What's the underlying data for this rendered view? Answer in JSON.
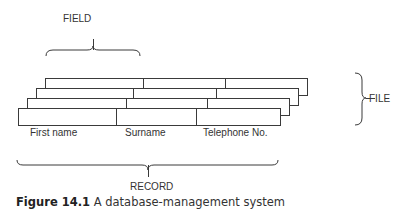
{
  "diagram": {
    "labels": {
      "field": "FIELD",
      "file": "FILE",
      "record": "RECORD"
    },
    "columns": [
      "First name",
      "Surname",
      "Telephone No."
    ],
    "record_count": 4,
    "line_color": "#3a3a3a"
  },
  "caption": {
    "number": "Figure 14.1",
    "text": "A database-management system"
  }
}
